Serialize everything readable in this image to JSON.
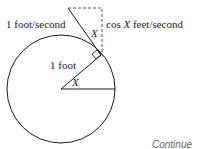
{
  "diagram": {
    "labels": {
      "velocity": "1 foot/second",
      "vertical_component_prefix": "cos ",
      "vertical_component_var": "X",
      "vertical_component_suffix": " feet/second",
      "radius": "1 foot",
      "angle_center": "X",
      "angle_tangent": "X"
    },
    "footer": "Continue"
  }
}
